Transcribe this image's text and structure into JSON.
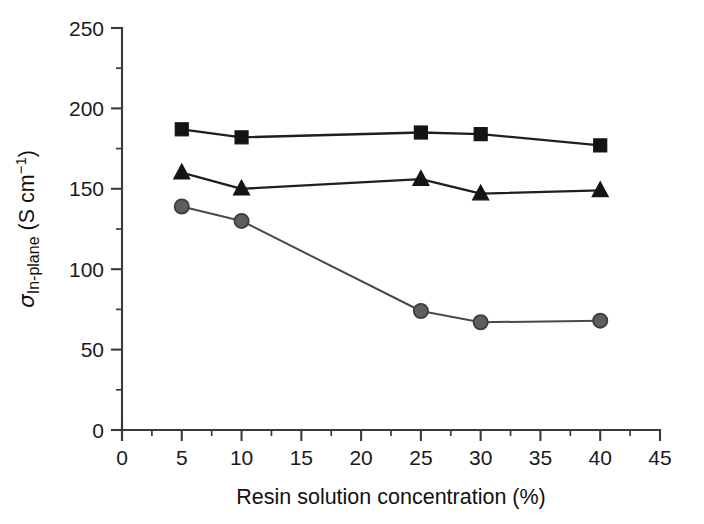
{
  "chart_data": {
    "type": "line",
    "title": "",
    "xlabel": "Resin solution concentration (%)",
    "ylabel_parts": {
      "symbol": "σ",
      "subscript": "In-plane",
      "units": " (S cm",
      "superscript": "−1",
      "units_close": ")"
    },
    "ylabel": "σIn-plane (S cm−1)",
    "x": [
      5,
      10,
      25,
      30,
      40
    ],
    "xlim": [
      0,
      45
    ],
    "ylim": [
      0,
      250
    ],
    "xticks": [
      0,
      5,
      10,
      15,
      20,
      25,
      30,
      35,
      40,
      45
    ],
    "xticklabels": [
      "0",
      "5",
      "10",
      "15",
      "20",
      "25",
      "30",
      "35",
      "40",
      "45"
    ],
    "xminorticks": [
      2.5,
      7.5,
      12.5,
      17.5,
      22.5,
      27.5,
      32.5,
      37.5,
      42.5
    ],
    "yticks": [
      0,
      50,
      100,
      150,
      200,
      250
    ],
    "yticklabels": [
      "0",
      "50",
      "100",
      "150",
      "200",
      "250"
    ],
    "yminorticks": [
      25,
      75,
      125,
      175,
      225
    ],
    "grid": false,
    "legend": "none",
    "series": [
      {
        "name": "square-series",
        "marker": "square",
        "color": "#141414",
        "fill": "#141414",
        "line_color": "#1f1f1f",
        "values": [
          187,
          182,
          185,
          184,
          177
        ]
      },
      {
        "name": "triangle-series",
        "marker": "triangle",
        "color": "#141414",
        "fill": "#141414",
        "line_color": "#1f1f1f",
        "values": [
          160,
          150,
          156,
          147,
          149
        ]
      },
      {
        "name": "circle-series",
        "marker": "circle",
        "color": "#3d3d3d",
        "fill": "#5e5e5e",
        "line_color": "#4a4a4a",
        "values": [
          139,
          130,
          74,
          67,
          68
        ]
      }
    ]
  },
  "figure": {
    "background_color": "#ffffff",
    "axis_color": "#3a3a3a",
    "text_color": "#1a1a1a"
  }
}
